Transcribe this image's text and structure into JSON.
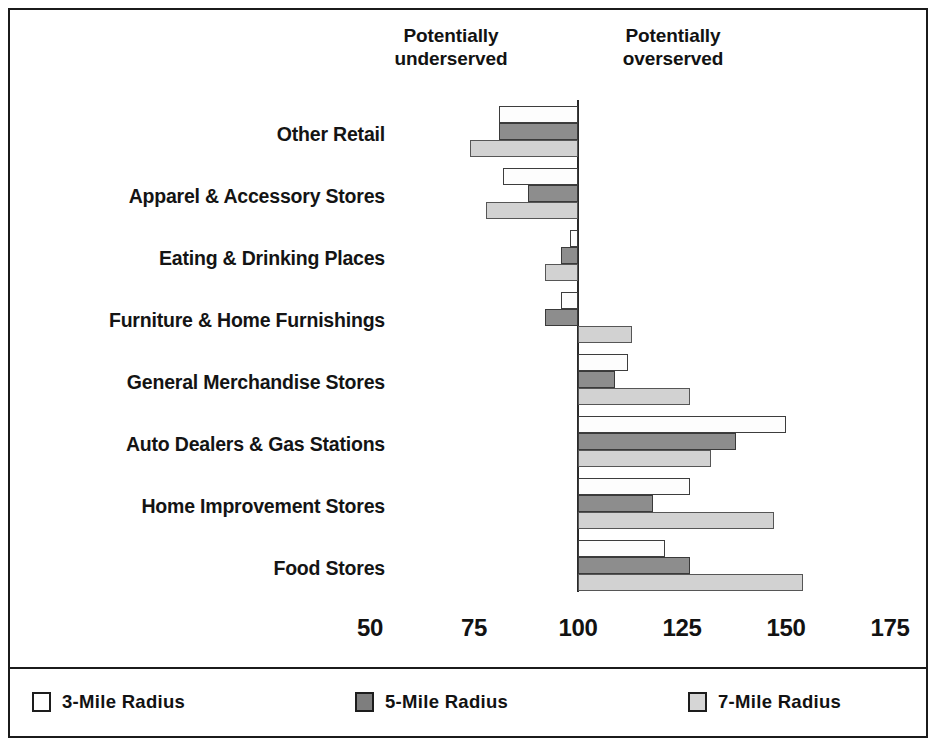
{
  "annotations": {
    "underserved": "Potentially\nunderserved",
    "overserved": "Potentially\noverserved"
  },
  "legend": {
    "items": [
      {
        "label": "3-Mile Radius",
        "swatch": "white-square-icon",
        "color": "#ffffff"
      },
      {
        "label": "5-Mile Radius",
        "swatch": "dark-gray-square-icon",
        "color": "#7e7e7e"
      },
      {
        "label": "7-Mile Radius",
        "swatch": "light-gray-square-icon",
        "color": "#d6d6d6"
      }
    ]
  },
  "chart_data": {
    "type": "bar",
    "orientation": "horizontal",
    "title": "",
    "xlabel": "",
    "ylabel": "",
    "baseline": 100,
    "xlim": [
      50,
      175
    ],
    "xticks": [
      50,
      75,
      100,
      125,
      150,
      175
    ],
    "grid": false,
    "legend_position": "bottom",
    "annotations": [
      "Potentially underserved",
      "Potentially overserved"
    ],
    "categories": [
      "Other Retail",
      "Apparel & Accessory Stores",
      "Eating & Drinking Places",
      "Furniture & Home Furnishings",
      "General Merchandise Stores",
      "Auto Dealers & Gas Stations",
      "Home Improvement Stores",
      "Food Stores"
    ],
    "series": [
      {
        "name": "3-Mile Radius",
        "color": "#ffffff",
        "values": [
          81,
          82,
          98,
          96,
          112,
          150,
          127,
          121
        ]
      },
      {
        "name": "5-Mile Radius",
        "color": "#8d8d8d",
        "values": [
          81,
          88,
          96,
          92,
          109,
          138,
          118,
          127
        ]
      },
      {
        "name": "7-Mile Radius",
        "color": "#d2d2d2",
        "values": [
          74,
          78,
          92,
          113,
          127,
          132,
          147,
          154
        ]
      }
    ]
  }
}
